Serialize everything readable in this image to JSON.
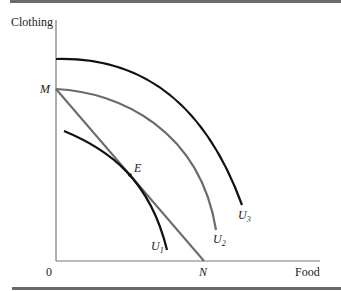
{
  "figure": {
    "y_axis_label": "Clothing",
    "x_axis_label": "Food",
    "origin_label": "0",
    "point_m": "M",
    "point_n": "N",
    "point_e": "E",
    "curves": [
      {
        "name": "U",
        "sub": "1",
        "color": "#111111"
      },
      {
        "name": "U",
        "sub": "2",
        "color": "#6a6a6a"
      },
      {
        "name": "U",
        "sub": "3",
        "color": "#111111"
      }
    ],
    "budget_line_color": "#6a6a6a",
    "rule_color": "#6a6a6a"
  }
}
